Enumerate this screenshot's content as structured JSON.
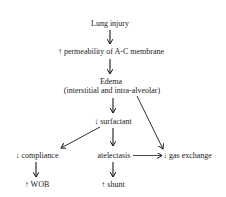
{
  "diagram": {
    "type": "flowchart",
    "nodes": [
      {
        "id": "lung_injury",
        "label": "Lung injury"
      },
      {
        "id": "permeability",
        "label": "↑ permeability of A-C membrane"
      },
      {
        "id": "edema",
        "label": "Edema"
      },
      {
        "id": "edema_sub",
        "label": "(interstitial and intra-alveolar)"
      },
      {
        "id": "surfactant",
        "label": "↓ surfactant"
      },
      {
        "id": "compliance",
        "label": "↓ compliance"
      },
      {
        "id": "atelectasis",
        "label": "atelectasis"
      },
      {
        "id": "gas_exchange",
        "label": "↓ gas exchange"
      },
      {
        "id": "wob",
        "label": "↑ WOB"
      },
      {
        "id": "shunt",
        "label": "↑ shunt"
      }
    ],
    "edges": [
      {
        "from": "lung_injury",
        "to": "permeability"
      },
      {
        "from": "permeability",
        "to": "edema"
      },
      {
        "from": "edema",
        "to": "surfactant"
      },
      {
        "from": "edema",
        "to": "gas_exchange"
      },
      {
        "from": "surfactant",
        "to": "compliance"
      },
      {
        "from": "surfactant",
        "to": "atelectasis"
      },
      {
        "from": "atelectasis",
        "to": "gas_exchange"
      },
      {
        "from": "compliance",
        "to": "wob"
      },
      {
        "from": "atelectasis",
        "to": "shunt"
      }
    ],
    "colors": {
      "text": "#1a1a1a",
      "line": "#1a1a1a",
      "background": "#ffffff"
    }
  }
}
